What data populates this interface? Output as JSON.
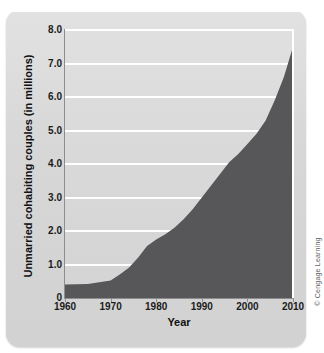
{
  "figure": {
    "credit": "© Cengage Learning"
  },
  "chart_data": {
    "type": "area",
    "title": "",
    "xlabel": "Year",
    "ylabel": "Unmarried cohabiting couples (in millions)",
    "xlim": [
      1960,
      2010
    ],
    "ylim": [
      0,
      8.0
    ],
    "grid": true,
    "legend": "none",
    "x_tick_labels": [
      "1960",
      "1970",
      "1980",
      "1990",
      "2000",
      "2010"
    ],
    "x_ticks": [
      1960,
      1970,
      1980,
      1990,
      2000,
      2010
    ],
    "y_tick_labels": [
      "0",
      "1.0",
      "2.0",
      "3.0",
      "4.0",
      "5.0",
      "6.0",
      "7.0",
      "8.0"
    ],
    "y_ticks": [
      0,
      1.0,
      2.0,
      3.0,
      4.0,
      5.0,
      6.0,
      7.0,
      8.0
    ],
    "series": [
      {
        "name": "Unmarried cohabiting couples",
        "fill_color": "#575759",
        "x": [
          1960,
          1965,
          1970,
          1972,
          1974,
          1976,
          1978,
          1980,
          1982,
          1984,
          1986,
          1988,
          1990,
          1992,
          1994,
          1996,
          1998,
          2000,
          2002,
          2004,
          2006,
          2008,
          2010
        ],
        "values": [
          0.4,
          0.42,
          0.52,
          0.7,
          0.9,
          1.2,
          1.55,
          1.75,
          1.9,
          2.1,
          2.35,
          2.65,
          3.0,
          3.35,
          3.7,
          4.05,
          4.3,
          4.6,
          4.9,
          5.3,
          5.9,
          6.6,
          7.5
        ]
      }
    ],
    "colors": {
      "plot_background": "#dcdcdc",
      "gridline": "#ffffff",
      "area_fill": "#575759",
      "card_background": "#d9d9d9",
      "axis": "#8d8d8d",
      "text": "#1b1b1b"
    }
  }
}
